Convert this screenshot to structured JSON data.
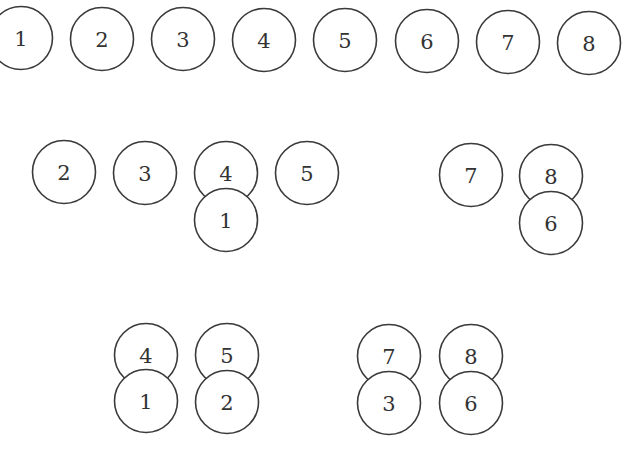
{
  "diagram": {
    "style": {
      "stroke": "#3a3a3a",
      "label_color": "#333333",
      "background": "#ffffff",
      "radius": 31.5
    },
    "rows": [
      {
        "name": "row-1-all-separate",
        "circles": [
          {
            "label": "1",
            "cx": 21,
            "cy": 38
          },
          {
            "label": "2",
            "cx": 102,
            "cy": 39
          },
          {
            "label": "3",
            "cx": 183,
            "cy": 39
          },
          {
            "label": "4",
            "cx": 264,
            "cy": 40
          },
          {
            "label": "5",
            "cx": 345,
            "cy": 40
          },
          {
            "label": "6",
            "cx": 427,
            "cy": 41
          },
          {
            "label": "7",
            "cx": 508,
            "cy": 42
          },
          {
            "label": "8",
            "cx": 589,
            "cy": 43
          }
        ]
      },
      {
        "name": "row-2-partially-stacked",
        "circles": [
          {
            "label": "2",
            "cx": 64,
            "cy": 172
          },
          {
            "label": "3",
            "cx": 145,
            "cy": 173
          },
          {
            "label": "4",
            "cx": 226,
            "cy": 173
          },
          {
            "label": "1",
            "cx": 226,
            "cy": 220
          },
          {
            "label": "5",
            "cx": 307,
            "cy": 173
          },
          {
            "label": "7",
            "cx": 471,
            "cy": 175
          },
          {
            "label": "8",
            "cx": 551,
            "cy": 176
          },
          {
            "label": "6",
            "cx": 551,
            "cy": 223
          }
        ]
      },
      {
        "name": "row-3-fully-paired",
        "circles": [
          {
            "label": "4",
            "cx": 146,
            "cy": 355
          },
          {
            "label": "1",
            "cx": 146,
            "cy": 401
          },
          {
            "label": "5",
            "cx": 227,
            "cy": 355
          },
          {
            "label": "2",
            "cx": 227,
            "cy": 402
          },
          {
            "label": "7",
            "cx": 389,
            "cy": 356
          },
          {
            "label": "3",
            "cx": 389,
            "cy": 403
          },
          {
            "label": "8",
            "cx": 471,
            "cy": 356
          },
          {
            "label": "6",
            "cx": 471,
            "cy": 403
          }
        ]
      }
    ]
  }
}
